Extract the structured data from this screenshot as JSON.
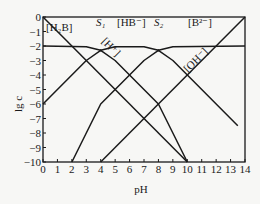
{
  "chart_data": {
    "type": "line",
    "title": "",
    "xlabel": "pH",
    "ylabel": "lg c",
    "xlim": [
      0,
      14
    ],
    "ylim": [
      -10,
      0
    ],
    "x_ticks": [
      "0",
      "1",
      "2",
      "3",
      "4",
      "5",
      "6",
      "7",
      "8",
      "9",
      "10",
      "11",
      "12",
      "13",
      "14"
    ],
    "y_ticks": [
      "0",
      "−1",
      "−2",
      "−3",
      "−4",
      "−5",
      "−6",
      "−7",
      "−8",
      "−9",
      "−10"
    ],
    "grid": false,
    "series": [
      {
        "name": "[H₂B]",
        "points": [
          [
            0,
            -2
          ],
          [
            3,
            -2.05
          ],
          [
            4,
            -2.3
          ],
          [
            5,
            -3
          ],
          [
            8,
            -6
          ],
          [
            10,
            -10
          ]
        ]
      },
      {
        "name": "[HB⁻]",
        "points": [
          [
            0,
            -6
          ],
          [
            3,
            -3
          ],
          [
            4,
            -2.3
          ],
          [
            5,
            -2.05
          ],
          [
            7,
            -2.05
          ],
          [
            8,
            -2.3
          ],
          [
            9,
            -3
          ],
          [
            13.5,
            -7.5
          ]
        ]
      },
      {
        "name": "[B²⁻]",
        "points": [
          [
            2,
            -10
          ],
          [
            4,
            -6
          ],
          [
            7,
            -3
          ],
          [
            8,
            -2.3
          ],
          [
            9,
            -2.05
          ],
          [
            14,
            -2
          ]
        ]
      },
      {
        "name": "[H⁺]",
        "points": [
          [
            0,
            0
          ],
          [
            10,
            -10
          ]
        ]
      },
      {
        "name": "[OH⁻]",
        "points": [
          [
            4,
            -10
          ],
          [
            14,
            0
          ]
        ]
      }
    ],
    "annotations": [
      {
        "text": "S₁",
        "x": 4,
        "y": -2.3
      },
      {
        "text": "S₂",
        "x": 8,
        "y": -2.3
      }
    ]
  },
  "labels": {
    "h2b": "[H₂B]",
    "hb": "[HB⁻]",
    "b2": "[B²⁻]",
    "h": "[H⁺]",
    "oh": "[OH⁻]",
    "s1": "S₁",
    "s2": "S₂",
    "xlabel": "pH",
    "ylabel": "lg c"
  }
}
